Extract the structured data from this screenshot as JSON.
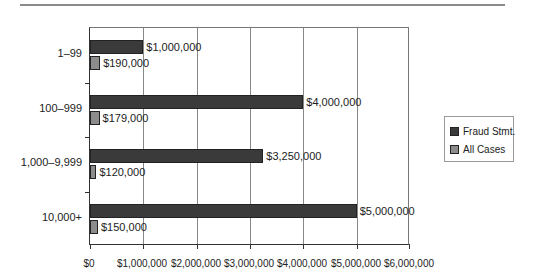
{
  "chart_data": {
    "type": "bar",
    "orientation": "horizontal",
    "title": "",
    "xlabel": "",
    "ylabel": "",
    "categories": [
      "1–99",
      "100–999",
      "1,000–9,999",
      "10,000+"
    ],
    "series": [
      {
        "name": "Fraud Stmt.",
        "color": "#3a3a3a",
        "values": [
          1000000,
          4000000,
          3250000,
          5000000
        ],
        "labels": [
          "$1,000,000",
          "$4,000,000",
          "$3,250,000",
          "$5,000,000"
        ]
      },
      {
        "name": "All Cases",
        "color": "#8c8c8c",
        "values": [
          190000,
          179000,
          120000,
          150000
        ],
        "labels": [
          "$190,000",
          "$179,000",
          "$120,000",
          "$150,000"
        ]
      }
    ],
    "xlim": [
      0,
      6000000
    ],
    "xticks": [
      "$0",
      "$1,000,000",
      "$2,000,000",
      "$3,000,000",
      "$4,000,000",
      "$5,000,000",
      "$6,000,000"
    ],
    "grid": true,
    "legend_position": "right"
  }
}
